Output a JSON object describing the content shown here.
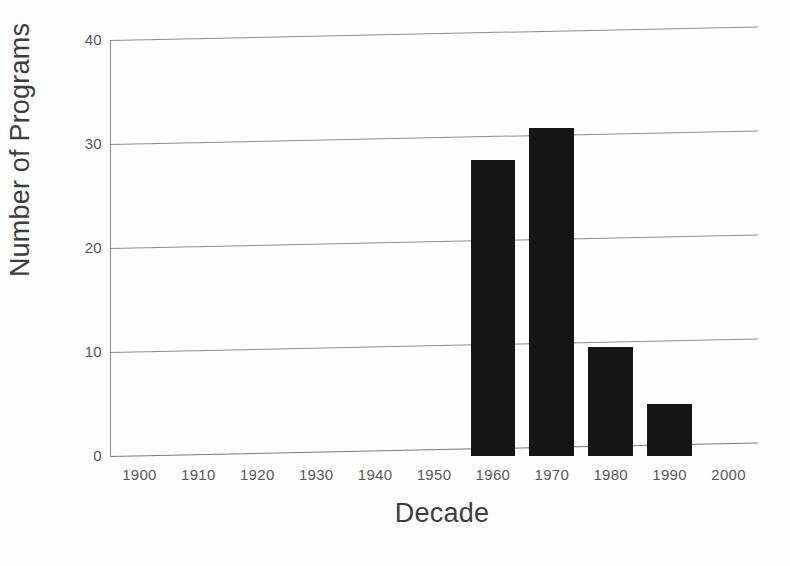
{
  "chart_data": {
    "type": "bar",
    "title": "",
    "subtitle": "",
    "xlabel": "Decade",
    "ylabel": "Number of Programs",
    "categories": [
      "1900",
      "1910",
      "1920",
      "1930",
      "1940",
      "1950",
      "1960",
      "1970",
      "1980",
      "1990",
      "2000"
    ],
    "values": [
      0,
      0,
      0,
      0,
      0,
      0,
      28.5,
      31.5,
      10.5,
      5,
      0
    ],
    "xlim": [
      "1900",
      "2000"
    ],
    "ylim": [
      0,
      40
    ],
    "y_ticks": [
      "0",
      "10",
      "20",
      "30",
      "40"
    ],
    "y_tick_values": [
      0,
      10,
      20,
      30,
      40
    ],
    "grid": "horizontal",
    "legend": "none",
    "bar_color": "#151515",
    "grid_color": "#8d8d8d",
    "text_color": "#58585a",
    "title_color": "#3d3d3f",
    "background": "#ffffff"
  },
  "axes": {
    "y_title": "Number of Programs",
    "x_title": "Decade"
  }
}
